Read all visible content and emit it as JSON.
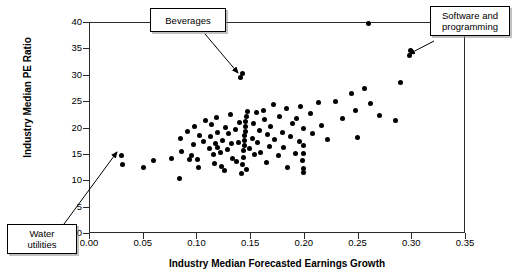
{
  "figure": {
    "width": 513,
    "height": 277,
    "background": "#ffffff",
    "marker_color": "#000000",
    "axis_color": "#2b2b2b"
  },
  "axes": {
    "x_title": "Industry Median Forecasted Earnings Growth",
    "y_title": "Industry Median PE Ratio",
    "x_ticks": [
      "0.00",
      "0.05",
      "0.10",
      "0.15",
      "0.20",
      "0.25",
      "0.30",
      "0.35"
    ],
    "y_ticks": [
      "0",
      "5",
      "10",
      "15",
      "20",
      "25",
      "30",
      "35",
      "40"
    ]
  },
  "annotations": [
    {
      "name": "beverages",
      "label": "Beverages",
      "target_x": 0.141,
      "target_y": 30.2
    },
    {
      "name": "software-and-programming",
      "label": "Software and\nprogramming",
      "target_x": 0.2985,
      "target_y": 34.3
    },
    {
      "name": "water-utilities",
      "label": "Water\nutilities",
      "target_x": 0.0305,
      "target_y": 14.5
    }
  ],
  "chart_data": {
    "type": "scatter",
    "title": "",
    "xlabel": "Industry Median Forecasted Earnings Growth",
    "ylabel": "Industry Median PE Ratio",
    "xlim": [
      0.0,
      0.35
    ],
    "ylim": [
      0,
      40
    ],
    "xticks": [
      0.0,
      0.05,
      0.1,
      0.15,
      0.2,
      0.25,
      0.3,
      0.35
    ],
    "yticks": [
      0,
      5,
      10,
      15,
      20,
      25,
      30,
      35,
      40
    ],
    "grid": false,
    "legend": false,
    "marker": "filled-circle",
    "series": [
      {
        "name": "Industries",
        "points": [
          [
            0.03,
            14.6
          ],
          [
            0.031,
            12.9
          ],
          [
            0.051,
            12.4
          ],
          [
            0.06,
            13.7
          ],
          [
            0.077,
            14.1
          ],
          [
            0.084,
            10.4
          ],
          [
            0.085,
            17.9
          ],
          [
            0.086,
            15.4
          ],
          [
            0.092,
            19.2
          ],
          [
            0.094,
            13.9
          ],
          [
            0.095,
            14.6
          ],
          [
            0.097,
            16.7
          ],
          [
            0.098,
            20.2
          ],
          [
            0.101,
            14.0
          ],
          [
            0.102,
            12.4
          ],
          [
            0.103,
            18.5
          ],
          [
            0.107,
            17.3
          ],
          [
            0.108,
            21.3
          ],
          [
            0.112,
            16.1
          ],
          [
            0.113,
            18.2
          ],
          [
            0.114,
            20.6
          ],
          [
            0.116,
            14.8
          ],
          [
            0.117,
            13.2
          ],
          [
            0.118,
            17.0
          ],
          [
            0.119,
            21.9
          ],
          [
            0.12,
            16.3
          ],
          [
            0.12,
            19.0
          ],
          [
            0.122,
            15.2
          ],
          [
            0.123,
            12.7
          ],
          [
            0.124,
            17.6
          ],
          [
            0.126,
            11.9
          ],
          [
            0.127,
            20.0
          ],
          [
            0.129,
            15.8
          ],
          [
            0.13,
            18.8
          ],
          [
            0.132,
            22.4
          ],
          [
            0.133,
            16.9
          ],
          [
            0.134,
            14.2
          ],
          [
            0.136,
            19.6
          ],
          [
            0.137,
            13.6
          ],
          [
            0.139,
            17.2
          ],
          [
            0.14,
            21.0
          ],
          [
            0.141,
            29.5
          ],
          [
            0.143,
            30.2
          ],
          [
            0.142,
            11.2
          ],
          [
            0.143,
            13.0
          ],
          [
            0.144,
            14.4
          ],
          [
            0.144,
            15.6
          ],
          [
            0.145,
            16.5
          ],
          [
            0.145,
            17.5
          ],
          [
            0.145,
            18.4
          ],
          [
            0.146,
            19.3
          ],
          [
            0.146,
            20.2
          ],
          [
            0.146,
            21.2
          ],
          [
            0.147,
            22.1
          ],
          [
            0.147,
            12.1
          ],
          [
            0.148,
            23.1
          ],
          [
            0.149,
            16.0
          ],
          [
            0.152,
            18.0
          ],
          [
            0.153,
            20.7
          ],
          [
            0.154,
            14.9
          ],
          [
            0.156,
            22.8
          ],
          [
            0.157,
            17.1
          ],
          [
            0.159,
            19.4
          ],
          [
            0.16,
            15.3
          ],
          [
            0.162,
            23.3
          ],
          [
            0.163,
            21.5
          ],
          [
            0.165,
            13.4
          ],
          [
            0.166,
            18.6
          ],
          [
            0.168,
            16.4
          ],
          [
            0.169,
            20.1
          ],
          [
            0.172,
            24.4
          ],
          [
            0.173,
            17.8
          ],
          [
            0.176,
            14.7
          ],
          [
            0.177,
            22.0
          ],
          [
            0.18,
            19.1
          ],
          [
            0.181,
            16.2
          ],
          [
            0.184,
            23.6
          ],
          [
            0.185,
            12.5
          ],
          [
            0.188,
            18.3
          ],
          [
            0.189,
            20.8
          ],
          [
            0.192,
            15.0
          ],
          [
            0.193,
            21.7
          ],
          [
            0.196,
            17.4
          ],
          [
            0.197,
            24.0
          ],
          [
            0.199,
            13.8
          ],
          [
            0.2,
            19.8
          ],
          [
            0.2,
            16.6
          ],
          [
            0.2,
            15.1
          ],
          [
            0.2,
            11.5
          ],
          [
            0.2,
            12.2
          ],
          [
            0.206,
            22.6
          ],
          [
            0.208,
            18.9
          ],
          [
            0.214,
            24.8
          ],
          [
            0.216,
            20.4
          ],
          [
            0.222,
            17.7
          ],
          [
            0.229,
            25.0
          ],
          [
            0.236,
            21.8
          ],
          [
            0.244,
            26.5
          ],
          [
            0.248,
            23.2
          ],
          [
            0.25,
            18.1
          ],
          [
            0.256,
            27.3
          ],
          [
            0.26,
            39.8
          ],
          [
            0.262,
            24.6
          ],
          [
            0.27,
            22.3
          ],
          [
            0.285,
            21.4
          ],
          [
            0.29,
            28.6
          ],
          [
            0.298,
            33.6
          ],
          [
            0.299,
            34.6
          ]
        ]
      }
    ]
  }
}
